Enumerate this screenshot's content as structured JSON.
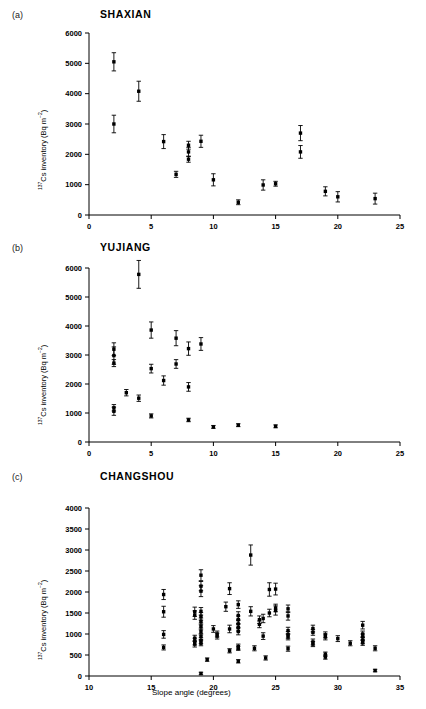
{
  "figure": {
    "ylabel": "137Cs inventory (Bq m-2)",
    "xlabel": "Slope angle (degrees)"
  },
  "panels": [
    {
      "label": "(a)",
      "title": "SHAXIAN"
    },
    {
      "label": "(b)",
      "title": "YUJIANG"
    },
    {
      "label": "(c)",
      "title": "CHANGSHOU"
    }
  ],
  "chart_data": [
    {
      "type": "scatter",
      "panel": "(a)",
      "title": "SHAXIAN",
      "xlabel": "",
      "ylabel": "137Cs inventory (Bq m-2)",
      "xlim": [
        0,
        25
      ],
      "ylim": [
        0,
        6000
      ],
      "xticks": [
        0,
        5,
        10,
        15,
        20,
        25
      ],
      "yticks": [
        0,
        1000,
        2000,
        3000,
        4000,
        5000,
        6000
      ],
      "grid": false,
      "legend": "none",
      "errorbars": "vertical, symmetric (±1 SD)",
      "points": [
        {
          "x": 2,
          "y": 5050,
          "err": 300
        },
        {
          "x": 2,
          "y": 3000,
          "err": 290
        },
        {
          "x": 4,
          "y": 4080,
          "err": 330
        },
        {
          "x": 6,
          "y": 2420,
          "err": 230
        },
        {
          "x": 7,
          "y": 1340,
          "err": 100
        },
        {
          "x": 8,
          "y": 2300,
          "err": 130
        },
        {
          "x": 8,
          "y": 2080,
          "err": 150
        },
        {
          "x": 8,
          "y": 1840,
          "err": 100
        },
        {
          "x": 9,
          "y": 2430,
          "err": 200
        },
        {
          "x": 10,
          "y": 1160,
          "err": 200
        },
        {
          "x": 12,
          "y": 420,
          "err": 80
        },
        {
          "x": 14,
          "y": 990,
          "err": 170
        },
        {
          "x": 15,
          "y": 1030,
          "err": 80
        },
        {
          "x": 17,
          "y": 2700,
          "err": 250
        },
        {
          "x": 17,
          "y": 2080,
          "err": 210
        },
        {
          "x": 19,
          "y": 780,
          "err": 150
        },
        {
          "x": 20,
          "y": 600,
          "err": 170
        },
        {
          "x": 23,
          "y": 540,
          "err": 180
        }
      ]
    },
    {
      "type": "scatter",
      "panel": "(b)",
      "title": "YUJIANG",
      "xlabel": "",
      "ylabel": "137Cs inventory (Bq m-2)",
      "xlim": [
        0,
        25
      ],
      "ylim": [
        0,
        6000
      ],
      "xticks": [
        0,
        5,
        10,
        15,
        20,
        25
      ],
      "yticks": [
        0,
        1000,
        2000,
        3000,
        4000,
        5000,
        6000
      ],
      "grid": false,
      "legend": "none",
      "errorbars": "vertical, symmetric (±1 SD)",
      "points": [
        {
          "x": 2,
          "y": 3200,
          "err": 220
        },
        {
          "x": 2,
          "y": 2980,
          "err": 300
        },
        {
          "x": 2,
          "y": 2720,
          "err": 120
        },
        {
          "x": 2,
          "y": 1180,
          "err": 110
        },
        {
          "x": 2,
          "y": 1060,
          "err": 140
        },
        {
          "x": 3,
          "y": 1700,
          "err": 110
        },
        {
          "x": 4,
          "y": 5780,
          "err": 480
        },
        {
          "x": 4,
          "y": 1510,
          "err": 110
        },
        {
          "x": 5,
          "y": 3860,
          "err": 280
        },
        {
          "x": 5,
          "y": 2530,
          "err": 150
        },
        {
          "x": 5,
          "y": 900,
          "err": 70
        },
        {
          "x": 6,
          "y": 2120,
          "err": 160
        },
        {
          "x": 7,
          "y": 3580,
          "err": 260
        },
        {
          "x": 7,
          "y": 2690,
          "err": 150
        },
        {
          "x": 8,
          "y": 3220,
          "err": 230
        },
        {
          "x": 8,
          "y": 1900,
          "err": 150
        },
        {
          "x": 8,
          "y": 760,
          "err": 60
        },
        {
          "x": 9,
          "y": 3380,
          "err": 220
        },
        {
          "x": 10,
          "y": 520,
          "err": 50
        },
        {
          "x": 12,
          "y": 580,
          "err": 50
        },
        {
          "x": 15,
          "y": 540,
          "err": 50
        }
      ]
    },
    {
      "type": "scatter",
      "panel": "(c)",
      "title": "CHANGSHOU",
      "xlabel": "Slope angle (degrees)",
      "ylabel": "137Cs inventory (Bq m-2)",
      "xlim": [
        10,
        35
      ],
      "ylim": [
        0,
        4000
      ],
      "xticks": [
        10,
        15,
        20,
        25,
        30,
        35
      ],
      "yticks": [
        0,
        500,
        1000,
        1500,
        2000,
        2500,
        3000,
        3500,
        4000
      ],
      "grid": false,
      "legend": "none",
      "errorbars": "vertical, symmetric (±1 SD)",
      "points": [
        {
          "x": 16,
          "y": 1940,
          "err": 120
        },
        {
          "x": 16,
          "y": 1530,
          "err": 130
        },
        {
          "x": 16,
          "y": 990,
          "err": 90
        },
        {
          "x": 16,
          "y": 680,
          "err": 60
        },
        {
          "x": 18.5,
          "y": 1530,
          "err": 110
        },
        {
          "x": 18.5,
          "y": 1450,
          "err": 100
        },
        {
          "x": 18.5,
          "y": 900,
          "err": 70
        },
        {
          "x": 18.5,
          "y": 820,
          "err": 80
        },
        {
          "x": 18.5,
          "y": 760,
          "err": 70
        },
        {
          "x": 19,
          "y": 2400,
          "err": 130
        },
        {
          "x": 19,
          "y": 2140,
          "err": 110
        },
        {
          "x": 19,
          "y": 2020,
          "err": 130
        },
        {
          "x": 19,
          "y": 1540,
          "err": 90
        },
        {
          "x": 19,
          "y": 1420,
          "err": 90
        },
        {
          "x": 19,
          "y": 1300,
          "err": 80
        },
        {
          "x": 19,
          "y": 1180,
          "err": 80
        },
        {
          "x": 19,
          "y": 1060,
          "err": 80
        },
        {
          "x": 19,
          "y": 940,
          "err": 70
        },
        {
          "x": 19,
          "y": 840,
          "err": 70
        },
        {
          "x": 19,
          "y": 780,
          "err": 60
        },
        {
          "x": 19,
          "y": 60,
          "err": 30
        },
        {
          "x": 19.5,
          "y": 390,
          "err": 40
        },
        {
          "x": 20,
          "y": 1120,
          "err": 80
        },
        {
          "x": 20.3,
          "y": 1000,
          "err": 70
        },
        {
          "x": 20.3,
          "y": 950,
          "err": 70
        },
        {
          "x": 21,
          "y": 1650,
          "err": 110
        },
        {
          "x": 21.3,
          "y": 2080,
          "err": 140
        },
        {
          "x": 21.3,
          "y": 1120,
          "err": 90
        },
        {
          "x": 21.3,
          "y": 600,
          "err": 50
        },
        {
          "x": 22,
          "y": 1700,
          "err": 90
        },
        {
          "x": 22,
          "y": 1440,
          "err": 90
        },
        {
          "x": 22,
          "y": 1340,
          "err": 90
        },
        {
          "x": 22,
          "y": 1240,
          "err": 80
        },
        {
          "x": 22,
          "y": 1150,
          "err": 80
        },
        {
          "x": 22,
          "y": 1060,
          "err": 80
        },
        {
          "x": 22,
          "y": 700,
          "err": 60
        },
        {
          "x": 22,
          "y": 660,
          "err": 50
        },
        {
          "x": 22,
          "y": 350,
          "err": 40
        },
        {
          "x": 23,
          "y": 2880,
          "err": 240
        },
        {
          "x": 23,
          "y": 1540,
          "err": 110
        },
        {
          "x": 23.3,
          "y": 660,
          "err": 60
        },
        {
          "x": 23.7,
          "y": 1340,
          "err": 90
        },
        {
          "x": 23.7,
          "y": 1230,
          "err": 80
        },
        {
          "x": 24,
          "y": 1370,
          "err": 100
        },
        {
          "x": 24,
          "y": 950,
          "err": 80
        },
        {
          "x": 24.2,
          "y": 430,
          "err": 50
        },
        {
          "x": 24.5,
          "y": 2060,
          "err": 160
        },
        {
          "x": 24.5,
          "y": 1500,
          "err": 90
        },
        {
          "x": 25,
          "y": 2070,
          "err": 140
        },
        {
          "x": 25,
          "y": 1620,
          "err": 90
        },
        {
          "x": 25,
          "y": 1560,
          "err": 110
        },
        {
          "x": 26,
          "y": 1600,
          "err": 90
        },
        {
          "x": 26,
          "y": 1430,
          "err": 100
        },
        {
          "x": 26,
          "y": 1080,
          "err": 80
        },
        {
          "x": 26,
          "y": 980,
          "err": 80
        },
        {
          "x": 26,
          "y": 930,
          "err": 70
        },
        {
          "x": 26,
          "y": 650,
          "err": 60
        },
        {
          "x": 28,
          "y": 1130,
          "err": 80
        },
        {
          "x": 28,
          "y": 1040,
          "err": 70
        },
        {
          "x": 28,
          "y": 810,
          "err": 70
        },
        {
          "x": 28,
          "y": 760,
          "err": 60
        },
        {
          "x": 29,
          "y": 980,
          "err": 70
        },
        {
          "x": 29,
          "y": 930,
          "err": 70
        },
        {
          "x": 29,
          "y": 520,
          "err": 50
        },
        {
          "x": 29,
          "y": 450,
          "err": 50
        },
        {
          "x": 30,
          "y": 890,
          "err": 70
        },
        {
          "x": 31,
          "y": 780,
          "err": 60
        },
        {
          "x": 32,
          "y": 1210,
          "err": 90
        },
        {
          "x": 32,
          "y": 1000,
          "err": 70
        },
        {
          "x": 32,
          "y": 930,
          "err": 70
        },
        {
          "x": 32,
          "y": 850,
          "err": 70
        },
        {
          "x": 32,
          "y": 790,
          "err": 60
        },
        {
          "x": 33,
          "y": 660,
          "err": 60
        },
        {
          "x": 33,
          "y": 130,
          "err": 30
        }
      ]
    }
  ]
}
